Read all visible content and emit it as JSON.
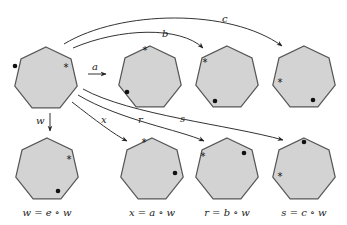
{
  "diagram": {
    "colors": {
      "fill": "#d3d3d3",
      "stroke": "#555555",
      "line": "#333333"
    },
    "polygons": [
      {
        "id": "e",
        "cx": 46,
        "cy": 79,
        "dot": [
          -31,
          -13
        ],
        "star": [
          20,
          -12
        ],
        "caption": ""
      },
      {
        "id": "a",
        "cx": 150,
        "cy": 78,
        "dot": [
          -23,
          14
        ],
        "star": [
          -5,
          -28
        ],
        "caption": ""
      },
      {
        "id": "b",
        "cx": 227,
        "cy": 78,
        "dot": [
          -12,
          23
        ],
        "star": [
          -22,
          -16
        ],
        "caption": ""
      },
      {
        "id": "c",
        "cx": 304,
        "cy": 78,
        "dot": [
          9,
          22
        ],
        "star": [
          -24,
          4
        ],
        "caption": ""
      },
      {
        "id": "w",
        "cx": 47,
        "cy": 170,
        "dot": [
          11,
          21
        ],
        "star": [
          22,
          -11
        ],
        "caption": "w = e ∘ w"
      },
      {
        "id": "x",
        "cx": 152,
        "cy": 170,
        "dot": [
          23,
          3
        ],
        "star": [
          -8,
          -28
        ],
        "caption": "x = a ∘ w"
      },
      {
        "id": "r",
        "cx": 227,
        "cy": 170,
        "dot": [
          17,
          -17
        ],
        "star": [
          -24,
          -14
        ],
        "caption": "r = b ∘ w"
      },
      {
        "id": "s",
        "cx": 304,
        "cy": 170,
        "dot": [
          0,
          -28
        ],
        "star": [
          -24,
          6
        ],
        "caption": "s = c ∘ w"
      }
    ],
    "arrows": [
      {
        "label": "a",
        "lx": 93,
        "ly": 69
      },
      {
        "label": "b",
        "lx": 164,
        "ly": 37
      },
      {
        "label": "c",
        "lx": 221,
        "ly": 22
      },
      {
        "label": "w",
        "lx": 38,
        "ly": 123
      },
      {
        "label": "x",
        "lx": 101,
        "ly": 122
      },
      {
        "label": "r",
        "lx": 138,
        "ly": 122
      },
      {
        "label": "s",
        "lx": 180,
        "ly": 122
      }
    ],
    "captions": [
      "w = e ∘ w",
      "x = a ∘ w",
      "r = b ∘ w",
      "s = c ∘ w"
    ]
  }
}
